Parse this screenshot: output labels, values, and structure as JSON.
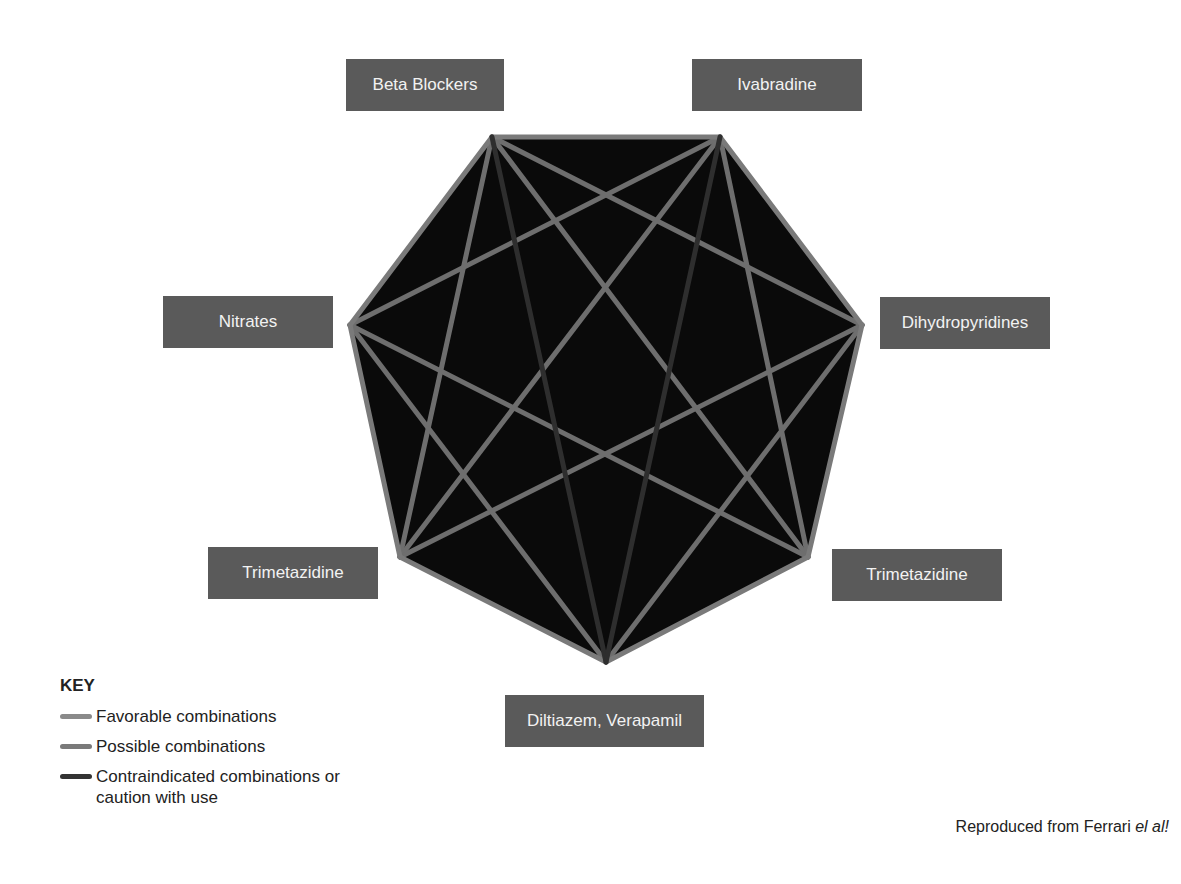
{
  "diagram": {
    "background_color": "#0a0a0a",
    "nodes": [
      {
        "id": "beta_blockers",
        "label": "Beta Blockers",
        "x": 492,
        "y": 137,
        "box": {
          "left": 346,
          "top": 59,
          "width": 158
        }
      },
      {
        "id": "ivabradine",
        "label": "Ivabradine",
        "x": 720,
        "y": 137,
        "box": {
          "left": 692,
          "top": 59,
          "width": 170
        }
      },
      {
        "id": "dihydropyridines",
        "label": "Dihydropyridines",
        "x": 862,
        "y": 325,
        "box": {
          "left": 880,
          "top": 297,
          "width": 170
        }
      },
      {
        "id": "trimetazidine_right",
        "label": "Trimetazidine",
        "x": 808,
        "y": 557,
        "box": {
          "left": 832,
          "top": 549,
          "width": 170
        }
      },
      {
        "id": "diltiazem_verapamil",
        "label": "Diltiazem, Verapamil",
        "x": 606,
        "y": 662,
        "box": {
          "left": 505,
          "top": 695,
          "width": 199
        }
      },
      {
        "id": "trimetazidine_left",
        "label": "Trimetazidine",
        "x": 400,
        "y": 557,
        "box": {
          "left": 208,
          "top": 547,
          "width": 170
        }
      },
      {
        "id": "nitrates",
        "label": "Nitrates",
        "x": 350,
        "y": 325,
        "box": {
          "left": 163,
          "top": 296,
          "width": 170
        }
      }
    ],
    "edges": [
      {
        "from": 0,
        "to": 1,
        "type": "favorable"
      },
      {
        "from": 1,
        "to": 2,
        "type": "favorable"
      },
      {
        "from": 2,
        "to": 3,
        "type": "favorable"
      },
      {
        "from": 3,
        "to": 4,
        "type": "favorable"
      },
      {
        "from": 4,
        "to": 5,
        "type": "favorable"
      },
      {
        "from": 5,
        "to": 6,
        "type": "favorable"
      },
      {
        "from": 6,
        "to": 0,
        "type": "favorable"
      },
      {
        "from": 0,
        "to": 2,
        "type": "possible"
      },
      {
        "from": 0,
        "to": 3,
        "type": "possible"
      },
      {
        "from": 0,
        "to": 5,
        "type": "possible"
      },
      {
        "from": 0,
        "to": 4,
        "type": "contraindicated"
      },
      {
        "from": 1,
        "to": 6,
        "type": "possible"
      },
      {
        "from": 1,
        "to": 5,
        "type": "possible"
      },
      {
        "from": 1,
        "to": 3,
        "type": "possible"
      },
      {
        "from": 1,
        "to": 4,
        "type": "contraindicated"
      },
      {
        "from": 2,
        "to": 5,
        "type": "possible"
      },
      {
        "from": 2,
        "to": 4,
        "type": "possible"
      },
      {
        "from": 6,
        "to": 3,
        "type": "possible"
      },
      {
        "from": 6,
        "to": 4,
        "type": "possible"
      }
    ],
    "edge_colors": {
      "favorable": "#7a7a7a",
      "possible": "#6e6e6e",
      "contraindicated": "#2e2e2e"
    }
  },
  "key": {
    "title": "KEY",
    "items": [
      {
        "label": "Favorable combinations",
        "color": "#8a8a8a"
      },
      {
        "label": "Possible combinations",
        "color": "#7a7a7a"
      },
      {
        "label": "Contraindicated combinations or caution with use",
        "color": "#333333"
      }
    ]
  },
  "credit": {
    "text": "Reproduced from Ferrari ",
    "italic": "el al!"
  }
}
